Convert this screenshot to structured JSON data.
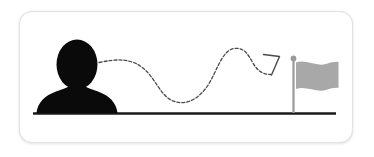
{
  "illustration": {
    "title": "journey-to-goal-illustration",
    "description": "Black person silhouette on a ground line connected by a dashed wavy path with an arrowhead pointing to a gray flag on a pole",
    "card": {
      "background_color": "#ffffff",
      "border_color": "#e2e2e2",
      "corner_radius": "13px"
    },
    "elements": {
      "person": {
        "name": "person-silhouette",
        "color": "#0a0a0a",
        "parts": [
          "head",
          "neck",
          "shoulders"
        ]
      },
      "ground": {
        "name": "ground-line",
        "color": "#1a1a1a",
        "thickness": "2.4px"
      },
      "path": {
        "name": "dashed-journey-path",
        "color": "#4a4a4a",
        "style": "dashed",
        "dash_pattern": "3 2",
        "stroke_width": "1.3px",
        "shape": "wavy-s-curve"
      },
      "arrowhead": {
        "name": "arrowhead",
        "color": "#4a4a4a",
        "direction": "up-right",
        "style": "open-chevron"
      },
      "flag": {
        "name": "goal-flag",
        "flag_color": "#a8a8a8",
        "pole_color": "#9a9a9a",
        "finial_color": "#9a9a9a",
        "shape": "wavy-banner"
      }
    }
  }
}
